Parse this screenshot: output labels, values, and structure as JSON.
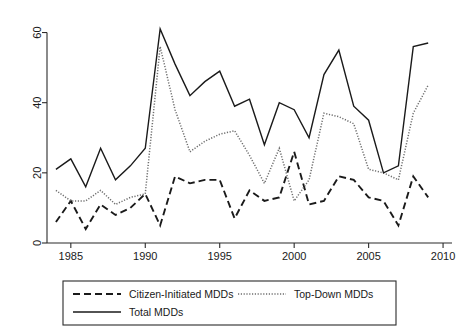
{
  "chart_data": {
    "type": "line",
    "title": "",
    "xlabel": "",
    "ylabel": "",
    "xlim": [
      1983.4,
      2010.6
    ],
    "ylim": [
      0,
      63
    ],
    "grid": false,
    "legend_position": "below-plot",
    "x_ticks": [
      1985,
      1990,
      1995,
      2000,
      2005,
      2010
    ],
    "x_tick_labels": [
      "1985",
      "1990",
      "1995",
      "2000",
      "2005",
      "2010"
    ],
    "y_ticks": [
      0,
      20,
      40,
      60
    ],
    "y_tick_labels": [
      "0",
      "20",
      "40",
      "60"
    ],
    "x": [
      1984,
      1985,
      1986,
      1987,
      1988,
      1989,
      1990,
      1991,
      1992,
      1993,
      1994,
      1995,
      1996,
      1997,
      1998,
      1999,
      2000,
      2001,
      2002,
      2003,
      2004,
      2005,
      2006,
      2007,
      2008,
      2009
    ],
    "series": [
      {
        "name": "Citizen-Initiated MDDs",
        "style": "dashed",
        "color": "#1a1a1a",
        "values": [
          6,
          12,
          4,
          11,
          8,
          10,
          14,
          5,
          19,
          17,
          18,
          18,
          7,
          15,
          12,
          13,
          26,
          11,
          12,
          19,
          18,
          13,
          12,
          5,
          19,
          13
        ]
      },
      {
        "name": "Top-Down MDDs",
        "style": "dotted",
        "color": "#6e6e6e",
        "values": [
          15,
          12,
          12,
          15,
          11,
          13,
          14,
          56,
          38,
          26,
          29,
          31,
          32,
          25,
          17,
          27,
          12,
          18,
          37,
          36,
          34,
          21,
          20,
          18,
          37,
          45
        ]
      },
      {
        "name": "Total MDDs",
        "style": "solid",
        "color": "#1a1a1a",
        "values": [
          21,
          24,
          16,
          27,
          18,
          22,
          27,
          61,
          51,
          42,
          46,
          49,
          39,
          41,
          28,
          40,
          38,
          30,
          48,
          55,
          39,
          35,
          20,
          22,
          56,
          57
        ]
      }
    ]
  },
  "legend": {
    "entries": [
      {
        "label": "Citizen-Initiated MDDs",
        "style": "dashed"
      },
      {
        "label": "Top-Down MDDs",
        "style": "dotted"
      },
      {
        "label": "Total MDDs",
        "style": "solid"
      }
    ]
  }
}
